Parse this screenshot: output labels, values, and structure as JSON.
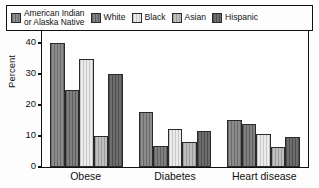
{
  "chart_data": {
    "type": "bar",
    "title": "",
    "xlabel": "",
    "ylabel": "Percent",
    "ylim": [
      0,
      50
    ],
    "yticks": [
      0,
      10,
      20,
      30,
      40,
      50
    ],
    "grid": false,
    "legend_position": "inside-top",
    "categories": [
      "Obese",
      "Diabetes",
      "Heart disease"
    ],
    "series": [
      {
        "name": "American Indian or Alaska Native",
        "name_line1": "American Indian",
        "name_line2": "or Alaska Native",
        "color": "#7c7c7c",
        "values": [
          40.0,
          17.8,
          15.1
        ]
      },
      {
        "name": "White",
        "color": "#6e6e6e",
        "values": [
          25.0,
          6.8,
          14.0
        ]
      },
      {
        "name": "Black",
        "color": "#e8e8e8",
        "values": [
          35.0,
          12.3,
          10.6
        ]
      },
      {
        "name": "Asian",
        "color": "#b6b6b6",
        "values": [
          10.0,
          8.0,
          6.4
        ]
      },
      {
        "name": "Hispanic",
        "color": "#5a5a5a",
        "values": [
          30.0,
          11.5,
          9.6
        ]
      }
    ]
  }
}
